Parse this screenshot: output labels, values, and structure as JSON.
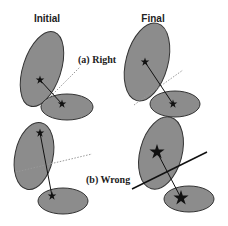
{
  "columns": {
    "initial": "Initial",
    "final": "Final"
  },
  "cases": [
    {
      "label": "(a) Right"
    },
    {
      "label": "(b) Wrong"
    }
  ],
  "colors": {
    "ellipse_fill": "#8c8c8c",
    "ellipse_stroke": "#333333",
    "star": "#111111",
    "dotted_line": "#999999",
    "solid_line": "#111111"
  }
}
